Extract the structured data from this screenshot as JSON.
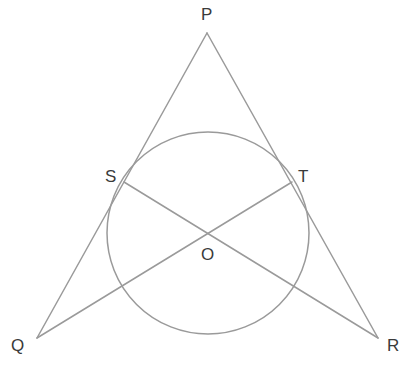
{
  "figure": {
    "width": 415,
    "height": 374,
    "background_color": "#ffffff",
    "line_color": "#9a9a9a",
    "label_color": "#3a3a3a",
    "line_width": 1.5
  },
  "labels": {
    "P": "P",
    "Q": "Q",
    "R": "R",
    "S": "S",
    "T": "T",
    "O": "O"
  },
  "chart_data": {
    "type": "diagram",
    "points": [
      {
        "name": "P",
        "x": 207,
        "y": 33,
        "label": "P",
        "label_x": 201,
        "label_y": 6,
        "role": "apex-vertex"
      },
      {
        "name": "Q",
        "x": 37,
        "y": 338,
        "label": "Q",
        "label_x": 11,
        "label_y": 337,
        "role": "bottom-left-vertex"
      },
      {
        "name": "R",
        "x": 378,
        "y": 338,
        "label": "R",
        "label_x": 387,
        "label_y": 337,
        "role": "bottom-right-vertex"
      },
      {
        "name": "S",
        "x": 124,
        "y": 182,
        "label": "S",
        "label_x": 105,
        "label_y": 168,
        "role": "tangent-point-on-PQ"
      },
      {
        "name": "T",
        "x": 292,
        "y": 182,
        "label": "T",
        "label_x": 298,
        "label_y": 168,
        "role": "tangent-point-on-PR"
      },
      {
        "name": "O",
        "x": 208,
        "y": 233,
        "label": "O",
        "label_x": 201,
        "label_y": 246,
        "role": "circle-center"
      }
    ],
    "circle": {
      "center_x": 208,
      "center_y": 233,
      "radius": 101,
      "stroke": "#9a9a9a"
    },
    "segments": [
      {
        "name": "PQ",
        "from": "P",
        "to": "Q",
        "x1": 207,
        "y1": 33,
        "x2": 37,
        "y2": 338,
        "note": "tangent side through S"
      },
      {
        "name": "PR",
        "from": "P",
        "to": "R",
        "x1": 207,
        "y1": 33,
        "x2": 378,
        "y2": 338,
        "note": "tangent side through T"
      },
      {
        "name": "SR",
        "from": "S",
        "to": "R",
        "x1": 124,
        "y1": 182,
        "x2": 378,
        "y2": 338,
        "note": "cevian crossing center region"
      },
      {
        "name": "TQ",
        "from": "T",
        "to": "Q",
        "x1": 292,
        "y1": 182,
        "x2": 37,
        "y2": 338,
        "note": "cevian crossing center region"
      }
    ]
  }
}
